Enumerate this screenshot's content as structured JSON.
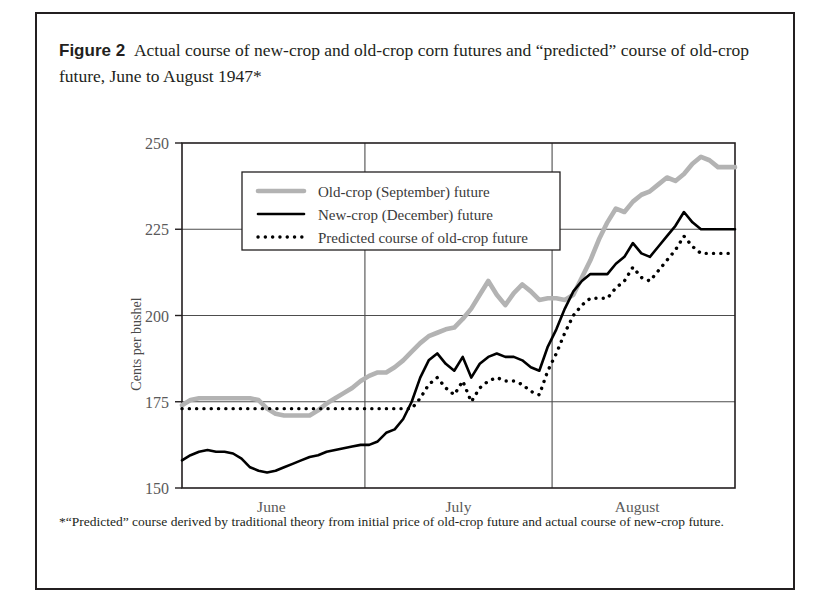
{
  "figure": {
    "number_label": "Figure 2",
    "caption": "Actual course of new-crop and old-crop corn futures and “predicted” course of old-crop future, June to August 1947*",
    "footnote": "*“Predicted” course derived by traditional theory from initial price of old-crop future and actual course of new-crop future."
  },
  "chart_data": {
    "type": "line",
    "title": "Actual course of new-crop and old-crop corn futures and “predicted” course of old-crop future, June to August 1947*",
    "xlabel": "",
    "ylabel": "Cents per bushel",
    "ylim": [
      150,
      250
    ],
    "yticks": [
      150,
      175,
      200,
      225,
      250
    ],
    "ytick_labels": [
      "150",
      "175",
      "200",
      "225",
      "250"
    ],
    "xlim": [
      0,
      65
    ],
    "grid": true,
    "month_labels": [
      "June",
      "July",
      "August"
    ],
    "month_centers": [
      10.5,
      32.5,
      53.5
    ],
    "month_dividers": [
      21.5,
      43.5
    ],
    "legend_position": "upper-left-inside",
    "colors": {
      "old_crop": "#b3b3b3",
      "new_crop": "#000000",
      "predicted": "#000000",
      "grid": "#4d4d4d",
      "frame": "#231f20",
      "text": "#231f20"
    },
    "series": [
      {
        "name": "Old-crop (September) future",
        "style": "solid",
        "color": "#b3b3b3",
        "x": [
          0,
          1,
          2,
          3,
          4,
          5,
          6,
          7,
          8,
          9,
          10,
          11,
          12,
          13,
          14,
          15,
          16,
          17,
          18,
          19,
          20,
          21,
          22,
          23,
          24,
          25,
          26,
          27,
          28,
          29,
          30,
          31,
          32,
          33,
          34,
          35,
          36,
          37,
          38,
          39,
          40,
          41,
          42,
          43,
          44,
          45,
          46,
          47,
          48,
          49,
          50,
          51,
          52,
          53,
          54,
          55,
          56,
          57,
          58,
          59,
          60,
          61,
          62,
          63,
          64,
          65
        ],
        "values": [
          174,
          175.5,
          176,
          176,
          176,
          176,
          176,
          176,
          176,
          175.5,
          173,
          171.5,
          171,
          171,
          171,
          171,
          172.5,
          174.5,
          176,
          177.5,
          179,
          181,
          182.5,
          183.5,
          183.5,
          185,
          187,
          189.5,
          192,
          194,
          195,
          196,
          196.5,
          199,
          202,
          206,
          210,
          206,
          203,
          206.5,
          209,
          207,
          204.5,
          205,
          205,
          204.5,
          206,
          211,
          216,
          222,
          227,
          231,
          230,
          233,
          235,
          236,
          238,
          240,
          239,
          241,
          244,
          246,
          245,
          243,
          243,
          243
        ],
        "labels": []
      },
      {
        "name": "New-crop (December) future",
        "style": "solid",
        "color": "#000000",
        "x": [
          0,
          1,
          2,
          3,
          4,
          5,
          6,
          7,
          8,
          9,
          10,
          11,
          12,
          13,
          14,
          15,
          16,
          17,
          18,
          19,
          20,
          21,
          22,
          23,
          24,
          25,
          26,
          27,
          28,
          29,
          30,
          31,
          32,
          33,
          34,
          35,
          36,
          37,
          38,
          39,
          40,
          41,
          42,
          43,
          44,
          45,
          46,
          47,
          48,
          49,
          50,
          51,
          52,
          53,
          54,
          55,
          56,
          57,
          58,
          59,
          60,
          61,
          62,
          63,
          64,
          65
        ],
        "values": [
          158,
          159.5,
          160.5,
          161,
          160.5,
          160.5,
          160,
          158.5,
          156,
          155,
          154.5,
          155,
          156,
          157,
          158,
          159,
          159.5,
          160.5,
          161,
          161.5,
          162,
          162.5,
          162.5,
          163.5,
          166,
          167,
          170,
          175,
          182,
          187,
          189,
          186,
          184,
          188,
          182,
          186,
          188,
          189,
          188,
          188,
          187,
          185,
          184,
          191,
          196,
          202,
          207,
          210,
          212,
          212,
          212,
          215,
          217,
          221,
          218,
          217,
          220,
          223,
          226,
          230,
          227,
          225,
          225,
          225,
          225,
          225
        ],
        "labels": []
      },
      {
        "name": "Predicted course of old-crop future",
        "style": "dotted",
        "color": "#000000",
        "x": [
          0,
          1,
          2,
          3,
          4,
          5,
          6,
          7,
          8,
          9,
          10,
          11,
          12,
          13,
          14,
          15,
          16,
          17,
          18,
          19,
          20,
          21,
          22,
          23,
          24,
          25,
          26,
          27,
          28,
          29,
          30,
          31,
          32,
          33,
          34,
          35,
          36,
          37,
          38,
          39,
          40,
          41,
          42,
          43,
          44,
          45,
          46,
          47,
          48,
          49,
          50,
          51,
          52,
          53,
          54,
          55,
          56,
          57,
          58,
          59,
          60,
          61,
          62,
          63,
          64,
          65
        ],
        "values": [
          173,
          173,
          173,
          173,
          173,
          173,
          173,
          173,
          173,
          173,
          173,
          173,
          173,
          173,
          173,
          173,
          173,
          173,
          173,
          173,
          173,
          173,
          173,
          173,
          173,
          173,
          173,
          173,
          176,
          180,
          182,
          179,
          177,
          181,
          175,
          179,
          181,
          182,
          181,
          181,
          180,
          178,
          177,
          184,
          189,
          195,
          200,
          203,
          205,
          205,
          205,
          208,
          210,
          214,
          211,
          210,
          213,
          216,
          219,
          223,
          220,
          218,
          218,
          218,
          218,
          218
        ],
        "labels": []
      }
    ],
    "legend_entries": [
      {
        "label": "Old-crop (September) future",
        "style": "solid",
        "color": "#b3b3b3"
      },
      {
        "label": "New-crop (December) future",
        "style": "solid",
        "color": "#000000"
      },
      {
        "label": "Predicted course of old-crop future",
        "style": "dotted",
        "color": "#000000"
      }
    ]
  }
}
